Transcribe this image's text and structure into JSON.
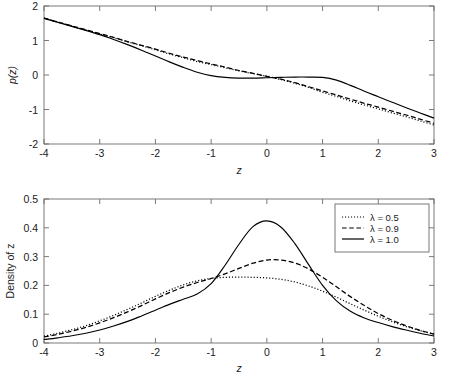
{
  "figure": {
    "background_color": "#ffffff",
    "axis_color": "#6b6b6b",
    "curve_color": "#000000"
  },
  "chart_data": [
    {
      "id": "top-panel",
      "type": "line",
      "title": "",
      "xlabel": "z",
      "ylabel": "p(z)",
      "xlim": [
        -4,
        3
      ],
      "ylim": [
        -2,
        2
      ],
      "xticks": [
        -4,
        -3,
        -2,
        -1,
        0,
        1,
        2,
        3
      ],
      "xtick_labels": [
        "-4",
        "-3",
        "-2",
        "-1",
        "0",
        "1",
        "2",
        "3"
      ],
      "yticks": [
        -2,
        -1,
        0,
        1,
        2
      ],
      "ytick_labels": [
        "-2",
        "-1",
        "0",
        "1",
        "2"
      ],
      "grid": false,
      "legend": null,
      "x": [
        -4,
        -3.5,
        -3,
        -2.75,
        -2.5,
        -2.25,
        -2,
        -1.75,
        -1.5,
        -1.25,
        -1,
        -0.75,
        -0.5,
        -0.25,
        0,
        0.25,
        0.5,
        0.75,
        1,
        1.25,
        1.5,
        1.75,
        2,
        2.25,
        2.5,
        2.75,
        3
      ],
      "series": [
        {
          "name": "lambda = 0.5",
          "style": "dotted",
          "values": [
            1.65,
            1.42,
            1.19,
            1.08,
            0.96,
            0.85,
            0.73,
            0.61,
            0.5,
            0.39,
            0.3,
            0.21,
            0.12,
            0.04,
            -0.04,
            -0.13,
            -0.24,
            -0.36,
            -0.5,
            -0.62,
            -0.75,
            -0.87,
            -0.98,
            -1.1,
            -1.21,
            -1.33,
            -1.45
          ]
        },
        {
          "name": "lambda = 0.9",
          "style": "dashed",
          "values": [
            1.65,
            1.42,
            1.2,
            1.09,
            0.97,
            0.86,
            0.75,
            0.63,
            0.52,
            0.42,
            0.32,
            0.23,
            0.13,
            0.05,
            -0.04,
            -0.12,
            -0.22,
            -0.34,
            -0.46,
            -0.58,
            -0.7,
            -0.82,
            -0.93,
            -1.05,
            -1.16,
            -1.28,
            -1.4
          ]
        },
        {
          "name": "lambda = 1.0",
          "style": "solid",
          "values": [
            1.64,
            1.41,
            1.17,
            1.03,
            0.88,
            0.72,
            0.55,
            0.38,
            0.22,
            0.08,
            -0.02,
            -0.07,
            -0.09,
            -0.09,
            -0.08,
            -0.07,
            -0.06,
            -0.06,
            -0.07,
            -0.15,
            -0.3,
            -0.47,
            -0.63,
            -0.79,
            -0.95,
            -1.1,
            -1.25
          ]
        }
      ]
    },
    {
      "id": "bottom-panel",
      "type": "line",
      "title": "",
      "xlabel": "z",
      "ylabel": "Density of z",
      "xlim": [
        -4,
        3
      ],
      "ylim": [
        0,
        0.5
      ],
      "xticks": [
        -4,
        -3,
        -2,
        -1,
        0,
        1,
        2,
        3
      ],
      "xtick_labels": [
        "-4",
        "-3",
        "-2",
        "-1",
        "0",
        "1",
        "2",
        "3"
      ],
      "yticks": [
        0,
        0.1,
        0.2,
        0.3,
        0.4,
        0.5
      ],
      "ytick_labels": [
        "0",
        "0.1",
        "0.2",
        "0.3",
        "0.4",
        "0.5"
      ],
      "grid": false,
      "legend": {
        "position": "top-right",
        "entries": [
          {
            "label": "λ = 0.5",
            "style": "dotted"
          },
          {
            "label": "λ = 0.9",
            "style": "dashed"
          },
          {
            "label": "λ = 1.0",
            "style": "solid"
          }
        ]
      },
      "x": [
        -4,
        -3.75,
        -3.5,
        -3.25,
        -3,
        -2.75,
        -2.5,
        -2.25,
        -2,
        -1.75,
        -1.5,
        -1.25,
        -1,
        -0.75,
        -0.5,
        -0.25,
        0,
        0.25,
        0.5,
        0.75,
        1,
        1.25,
        1.5,
        1.75,
        2,
        2.25,
        2.5,
        2.75,
        3
      ],
      "series": [
        {
          "name": "λ = 0.5",
          "style": "dotted",
          "values": [
            0.024,
            0.034,
            0.046,
            0.06,
            0.077,
            0.096,
            0.117,
            0.139,
            0.162,
            0.183,
            0.202,
            0.216,
            0.224,
            0.228,
            0.229,
            0.228,
            0.226,
            0.221,
            0.212,
            0.198,
            0.18,
            0.159,
            0.136,
            0.114,
            0.093,
            0.074,
            0.057,
            0.043,
            0.031
          ]
        },
        {
          "name": "λ = 0.9",
          "style": "dashed",
          "values": [
            0.021,
            0.03,
            0.041,
            0.054,
            0.07,
            0.088,
            0.108,
            0.13,
            0.153,
            0.175,
            0.194,
            0.21,
            0.224,
            0.24,
            0.259,
            0.277,
            0.288,
            0.288,
            0.278,
            0.257,
            0.228,
            0.195,
            0.161,
            0.13,
            0.102,
            0.079,
            0.06,
            0.044,
            0.031
          ]
        },
        {
          "name": "λ = 1.0",
          "style": "solid",
          "values": [
            0.012,
            0.018,
            0.025,
            0.034,
            0.045,
            0.059,
            0.075,
            0.094,
            0.114,
            0.134,
            0.152,
            0.17,
            0.206,
            0.27,
            0.343,
            0.404,
            0.424,
            0.403,
            0.346,
            0.272,
            0.2,
            0.146,
            0.11,
            0.087,
            0.071,
            0.057,
            0.045,
            0.034,
            0.024
          ]
        }
      ]
    }
  ]
}
